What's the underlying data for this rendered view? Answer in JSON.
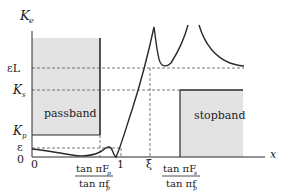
{
  "diagram": {
    "y_axis_label": "K",
    "y_axis_sub": "e",
    "x_axis_label": "x",
    "y_ticks": {
      "eps_L": "εL",
      "Ks": "K",
      "Ks_sub": "s",
      "Kp": "K",
      "Kp_sub": "p",
      "eps": "ε",
      "zero": "0"
    },
    "x_ticks": {
      "zero": "0",
      "passband_edge_num": "tan πF",
      "passband_edge_num_sub": "p",
      "passband_edge_den": "tan πf",
      "passband_edge_den_sub": "p",
      "one": "1",
      "xi": "ξ",
      "stopband_edge_num": "tan πF",
      "stopband_edge_num_sub": "s",
      "stopband_edge_den": "tan πf",
      "stopband_edge_den_sub": "p"
    },
    "regions": {
      "passband": "passband",
      "stopband": "stopband"
    },
    "colors": {
      "region_fill": "#e3e3e3",
      "line": "#2a2a2a",
      "dash": "#555555"
    }
  }
}
